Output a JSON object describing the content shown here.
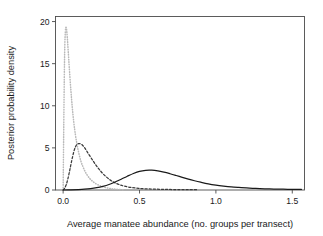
{
  "chart_data": {
    "type": "line",
    "title": "",
    "xlabel": "Average manatee abundance (no. groups per transect)",
    "ylabel": "Posterior probability density",
    "xlim": [
      -0.05,
      1.58
    ],
    "ylim": [
      0,
      20.6
    ],
    "xticks": [
      0.0,
      0.5,
      1.0,
      1.5
    ],
    "xticklabels": [
      "0.0",
      "0.5",
      "1.0",
      "1.5"
    ],
    "yticks": [
      0,
      5,
      10,
      15,
      20
    ],
    "yticklabels": [
      "0",
      "5",
      "10",
      "15",
      "20"
    ],
    "grid": false,
    "legend": "none",
    "frame": "box",
    "series": [
      {
        "name": "dotted-light-gray-posterior",
        "style": "dotted",
        "color": "#b9b9b9",
        "peak_x": 0.02,
        "peak_y": 19.3,
        "x": [
          0.0,
          0.005,
          0.01,
          0.015,
          0.02,
          0.025,
          0.03,
          0.035,
          0.04,
          0.05,
          0.06,
          0.07,
          0.08,
          0.09,
          0.1,
          0.115,
          0.13,
          0.145,
          0.16,
          0.175,
          0.19,
          0.21,
          0.23,
          0.25,
          0.27,
          0.29,
          0.31,
          0.33,
          0.36,
          0.4
        ],
        "y": [
          0.0,
          9.2,
          16.4,
          18.9,
          19.3,
          18.6,
          17.4,
          16.0,
          14.6,
          12.0,
          9.8,
          8.0,
          6.6,
          5.5,
          4.6,
          3.5,
          2.75,
          2.15,
          1.7,
          1.35,
          1.08,
          0.8,
          0.6,
          0.45,
          0.33,
          0.24,
          0.17,
          0.12,
          0.07,
          0.03
        ]
      },
      {
        "name": "dashed-dark-posterior",
        "style": "dashed",
        "color": "#3a3a3a",
        "peak_x": 0.11,
        "peak_y": 5.5,
        "x": [
          0.0,
          0.01,
          0.02,
          0.03,
          0.04,
          0.05,
          0.06,
          0.07,
          0.08,
          0.09,
          0.1,
          0.11,
          0.12,
          0.13,
          0.14,
          0.15,
          0.165,
          0.18,
          0.195,
          0.21,
          0.225,
          0.24,
          0.26,
          0.28,
          0.3,
          0.32,
          0.34,
          0.37,
          0.4,
          0.44,
          0.48,
          0.52,
          0.58,
          0.64,
          0.7,
          0.76,
          0.82,
          0.88
        ],
        "y": [
          0.0,
          0.22,
          0.62,
          1.25,
          2.05,
          2.95,
          3.8,
          4.55,
          5.1,
          5.4,
          5.5,
          5.5,
          5.42,
          5.25,
          5.02,
          4.75,
          4.32,
          3.9,
          3.48,
          3.08,
          2.7,
          2.36,
          1.95,
          1.6,
          1.3,
          1.05,
          0.85,
          0.62,
          0.46,
          0.31,
          0.22,
          0.16,
          0.11,
          0.08,
          0.06,
          0.05,
          0.04,
          0.035
        ]
      },
      {
        "name": "solid-black-posterior",
        "style": "solid",
        "color": "#1a1a1a",
        "peak_x": 0.52,
        "peak_y": 2.35,
        "x": [
          0.0,
          0.05,
          0.1,
          0.14,
          0.18,
          0.22,
          0.26,
          0.3,
          0.34,
          0.38,
          0.42,
          0.46,
          0.5,
          0.54,
          0.58,
          0.62,
          0.66,
          0.7,
          0.74,
          0.78,
          0.82,
          0.86,
          0.9,
          0.95,
          1.0,
          1.05,
          1.1,
          1.15,
          1.2,
          1.26,
          1.32,
          1.38,
          1.44,
          1.5,
          1.56
        ],
        "y": [
          0.0,
          0.02,
          0.05,
          0.09,
          0.16,
          0.27,
          0.43,
          0.65,
          0.95,
          1.28,
          1.63,
          1.96,
          2.22,
          2.34,
          2.35,
          2.27,
          2.12,
          1.93,
          1.72,
          1.5,
          1.29,
          1.1,
          0.93,
          0.74,
          0.59,
          0.47,
          0.37,
          0.3,
          0.24,
          0.18,
          0.14,
          0.11,
          0.09,
          0.07,
          0.06
        ]
      }
    ]
  },
  "axes": {
    "xlabel": "Average manatee abundance (no. groups per transect)",
    "ylabel": "Posterior probability density"
  }
}
